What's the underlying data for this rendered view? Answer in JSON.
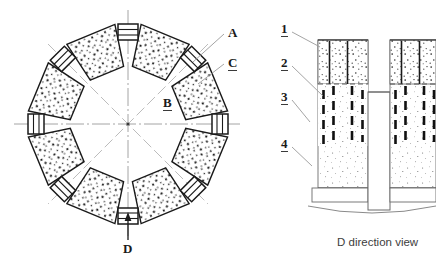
{
  "figure": {
    "title_caption": "D direction view",
    "left_view": {
      "name": "segmented-ring-plan-view",
      "segment_count": 8,
      "labels": [
        {
          "id": "A",
          "text": "A",
          "underlined": false,
          "x": 228,
          "y": 33,
          "leader_to": [
            196,
            60
          ]
        },
        {
          "id": "C",
          "text": "C",
          "underlined": true,
          "x": 228,
          "y": 62,
          "leader_to": [
            200,
            84
          ]
        },
        {
          "id": "B",
          "text": "B",
          "underlined": true,
          "x": 163,
          "y": 102,
          "leader_to": null
        },
        {
          "id": "D",
          "text": "D",
          "underlined": false,
          "x": 127,
          "y": 243,
          "leader_to": null
        }
      ],
      "direction_arrow": {
        "name": "d-direction-arrow",
        "points_up": true
      }
    },
    "right_view": {
      "name": "d-direction-section-view",
      "labels": [
        {
          "id": "1",
          "text": "1",
          "underlined": true,
          "x": 283,
          "y": 28,
          "leader_to": [
            320,
            48
          ]
        },
        {
          "id": "2",
          "text": "2",
          "underlined": true,
          "x": 283,
          "y": 62,
          "leader_to": [
            322,
            95
          ]
        },
        {
          "id": "3",
          "text": "3",
          "underlined": true,
          "x": 283,
          "y": 96,
          "leader_to": [
            308,
            120
          ]
        },
        {
          "id": "4",
          "text": "4",
          "underlined": true,
          "x": 283,
          "y": 143,
          "leader_to": [
            310,
            163
          ]
        }
      ]
    }
  },
  "colors": {
    "ink": "#1a1a1a",
    "stipple": "#222222",
    "light_line": "#9a9a9a",
    "centerline": "#8f8f8f",
    "fill": "#ffffff",
    "caption": "#3d3d3d"
  }
}
